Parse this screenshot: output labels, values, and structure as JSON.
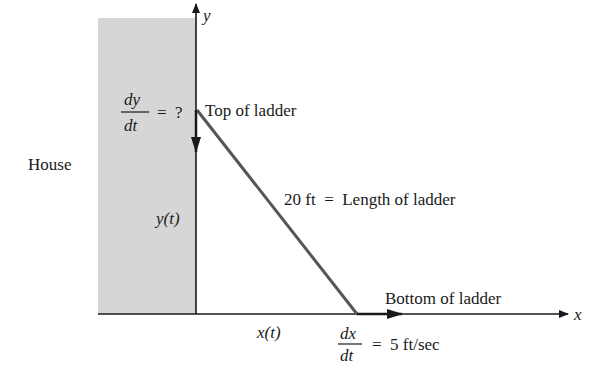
{
  "diagram": {
    "house_label": "House",
    "axes": {
      "x_label": "x",
      "y_label": "y"
    },
    "top_label": "Top of ladder",
    "bottom_label": "Bottom of ladder",
    "length_label": "20 ft  =  Length of ladder",
    "y_of_t": "y(t)",
    "x_of_t": "x(t)",
    "dy_dt": {
      "num": "dy",
      "den": "dt",
      "rest": "=  ?"
    },
    "dx_dt": {
      "num": "dx",
      "den": "dt",
      "rest": "=  5 ft/sec"
    },
    "colors": {
      "house_fill": "#d6d6d6",
      "ladder": "#555555",
      "axis": "#1a1a1a"
    }
  }
}
